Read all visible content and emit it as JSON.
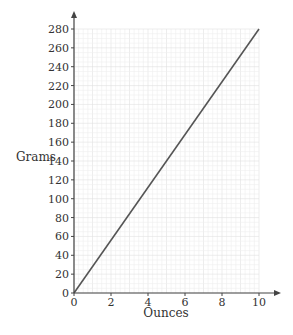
{
  "chart_data": {
    "type": "line",
    "title": "",
    "xlabel": "Ounces",
    "ylabel": "Grams",
    "xlim": [
      0,
      10
    ],
    "ylim": [
      0,
      280
    ],
    "x_ticks": [
      0,
      2,
      4,
      6,
      8,
      10
    ],
    "y_ticks": [
      0,
      20,
      40,
      60,
      80,
      100,
      120,
      140,
      160,
      180,
      200,
      220,
      240,
      260,
      280
    ],
    "grid": true,
    "legend": null,
    "series": [
      {
        "name": "Grams vs Ounces",
        "x": [
          0,
          10
        ],
        "y": [
          0,
          280
        ],
        "color": "#555555"
      }
    ]
  },
  "colors": {
    "axis": "#444444",
    "line": "#555555",
    "grid_minor": "#eeeeee",
    "grid_major": "#e0e0e0"
  }
}
